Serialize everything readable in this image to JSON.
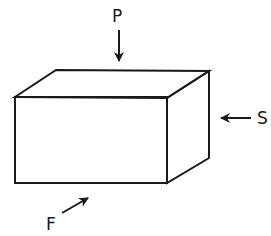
{
  "diagram": {
    "type": "force-diagram",
    "object": "rectangular block (3D box)",
    "colors": {
      "stroke": "#1a1a1a",
      "background": "#ffffff"
    },
    "box": {
      "front_face": {
        "x1": 15,
        "y1": 97,
        "x2": 167,
        "y2": 183
      },
      "back_top_left": [
        56,
        70
      ],
      "back_top_right": [
        209,
        71
      ],
      "back_bottom_right": [
        209,
        158
      ]
    },
    "forces": [
      {
        "label": "P",
        "direction": "down",
        "description": "downward force on top face",
        "label_pos": [
          118,
          22
        ],
        "from": [
          119,
          30
        ],
        "to": [
          119,
          62
        ]
      },
      {
        "label": "S",
        "direction": "left",
        "description": "leftward force on right face",
        "label_pos": [
          258,
          124
        ],
        "from": [
          251,
          118
        ],
        "to": [
          220,
          118
        ]
      },
      {
        "label": "F",
        "direction": "up-right",
        "description": "diagonal force on front-bottom",
        "label_pos": [
          46,
          230
        ],
        "from": [
          62,
          213
        ],
        "to": [
          89,
          197
        ]
      }
    ]
  }
}
